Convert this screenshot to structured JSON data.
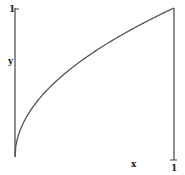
{
  "chart_data": {
    "type": "line",
    "title": "",
    "xlabel": "x",
    "ylabel": "y",
    "xlim": [
      0,
      1
    ],
    "ylim": [
      0,
      1
    ],
    "grid": false,
    "legend": null,
    "x_tick_labels": [
      "1"
    ],
    "y_tick_labels": [
      "1"
    ],
    "series": [
      {
        "name": "y = sqrt(x)",
        "x": [
          0,
          0.01,
          0.05,
          0.1,
          0.2,
          0.3,
          0.4,
          0.5,
          0.6,
          0.7,
          0.8,
          0.9,
          1.0
        ],
        "values": [
          0,
          0.1,
          0.224,
          0.316,
          0.447,
          0.548,
          0.632,
          0.707,
          0.775,
          0.837,
          0.894,
          0.949,
          1.0
        ]
      }
    ]
  },
  "labels": {
    "x_axis": "x",
    "y_axis": "y",
    "x_max": "1",
    "y_max": "1"
  },
  "colors": {
    "line": "#555555",
    "axis": "#444444",
    "text": "#222222"
  }
}
